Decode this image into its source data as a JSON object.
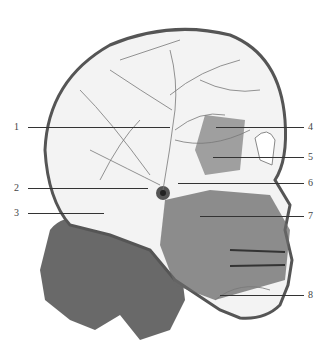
{
  "figure": {
    "colors": {
      "skull": "#f2f2f2",
      "vessels": "#6a6a6a",
      "tissue": "#5c5c5c",
      "line": "#333333"
    }
  },
  "callouts": [
    {
      "number": "1",
      "side": "left",
      "label_x": 17,
      "y": 127,
      "line_x1": 28,
      "line_x2": 170
    },
    {
      "number": "2",
      "side": "left",
      "label_x": 17,
      "y": 188,
      "line_x1": 28,
      "line_x2": 148
    },
    {
      "number": "3",
      "side": "left",
      "label_x": 17,
      "y": 213,
      "line_x1": 28,
      "line_x2": 104
    },
    {
      "number": "4",
      "side": "right",
      "label_x": 311,
      "y": 127,
      "line_x1": 216,
      "line_x2": 304
    },
    {
      "number": "5",
      "side": "right",
      "label_x": 311,
      "y": 157,
      "line_x1": 213,
      "line_x2": 304
    },
    {
      "number": "6",
      "side": "right",
      "label_x": 311,
      "y": 183,
      "line_x1": 178,
      "line_x2": 304
    },
    {
      "number": "7",
      "side": "right",
      "label_x": 311,
      "y": 216,
      "line_x1": 200,
      "line_x2": 304
    },
    {
      "number": "8",
      "side": "right",
      "label_x": 311,
      "y": 295,
      "line_x1": 220,
      "line_x2": 304
    }
  ]
}
